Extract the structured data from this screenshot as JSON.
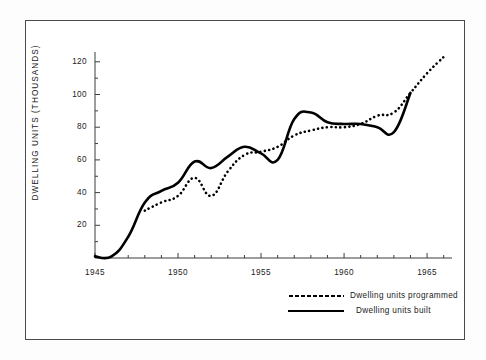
{
  "chart_data": {
    "type": "line",
    "title": "",
    "xlabel": "",
    "ylabel": "DWELLING  UNITS  (THOUSANDS)",
    "xlim": [
      1945,
      1966.5
    ],
    "ylim": [
      0,
      126
    ],
    "grid": false,
    "legend_position": "bottom-right",
    "x_ticks": [
      1945,
      1950,
      1955,
      1960,
      1965
    ],
    "x_tick_labels": [
      "1945",
      "1950",
      "1955",
      "1960",
      "1965"
    ],
    "x_minor_tick_step": 1,
    "y_ticks": [
      20,
      40,
      60,
      80,
      100,
      120
    ],
    "y_tick_labels": [
      "20",
      "40",
      "60",
      "80",
      "100",
      "120"
    ],
    "y_minor_tick_step": 10,
    "series": [
      {
        "name": "Dwelling units programmed",
        "style": "dotted",
        "color": "#000000",
        "x": [
          1948,
          1949,
          1950,
          1951,
          1952,
          1953,
          1954,
          1955,
          1956,
          1957,
          1958,
          1959,
          1960,
          1961,
          1962,
          1963,
          1964,
          1965,
          1966
        ],
        "values": [
          29,
          34,
          38,
          49,
          38,
          53,
          63,
          65,
          68,
          75,
          78,
          80,
          80,
          82,
          87,
          89,
          101,
          113,
          123
        ]
      },
      {
        "name": "Dwelling units built",
        "style": "solid",
        "color": "#000000",
        "x": [
          1945,
          1946,
          1947,
          1948,
          1949,
          1950,
          1951,
          1952,
          1953,
          1954,
          1955,
          1956,
          1957,
          1958,
          1959,
          1960,
          1961,
          1962,
          1963,
          1964
        ],
        "values": [
          1,
          1,
          13,
          34,
          41,
          46,
          59,
          55,
          62,
          68,
          64,
          60,
          85,
          89,
          83,
          82,
          82,
          80,
          77,
          101
        ]
      }
    ]
  },
  "legend": {
    "items": [
      {
        "label": "Dwelling units programmed",
        "style": "dotted"
      },
      {
        "label": "Dwelling units built",
        "style": "solid"
      }
    ]
  }
}
